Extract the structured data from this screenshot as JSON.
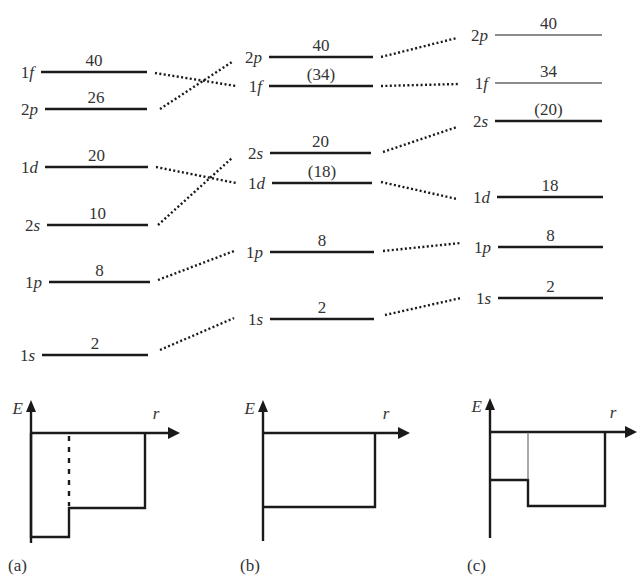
{
  "figure": {
    "columns": [
      {
        "id": "a",
        "levels": [
          {
            "n": "1",
            "l": "f",
            "count": "40",
            "y": 72,
            "x1": 41,
            "x2": 147,
            "w": 2.6
          },
          {
            "n": "2",
            "l": "p",
            "count": "26",
            "y": 109,
            "x1": 45,
            "x2": 147,
            "w": 2.6
          },
          {
            "n": "1",
            "l": "d",
            "count": "20",
            "y": 167,
            "x1": 45,
            "x2": 148,
            "w": 2.6
          },
          {
            "n": "2",
            "l": "s",
            "count": "10",
            "y": 225,
            "x1": 47,
            "x2": 148,
            "w": 2.6
          },
          {
            "n": "1",
            "l": "p",
            "count": "8",
            "y": 282,
            "x1": 49,
            "x2": 150,
            "w": 2.6
          },
          {
            "n": "1",
            "l": "s",
            "count": "2",
            "y": 355,
            "x1": 42,
            "x2": 148,
            "w": 2.6
          }
        ]
      },
      {
        "id": "b",
        "levels": [
          {
            "n": "2",
            "l": "p",
            "count": "40",
            "y": 57,
            "x1": 269,
            "x2": 373,
            "w": 2.6
          },
          {
            "n": "1",
            "l": "f",
            "count": "(34)",
            "y": 86,
            "x1": 269,
            "x2": 373,
            "w": 2.6
          },
          {
            "n": "2",
            "l": "s",
            "count": "20",
            "y": 153,
            "x1": 270,
            "x2": 371,
            "w": 2.6
          },
          {
            "n": "1",
            "l": "d",
            "count": "(18)",
            "y": 183,
            "x1": 272,
            "x2": 372,
            "w": 2.6
          },
          {
            "n": "1",
            "l": "p",
            "count": "8",
            "y": 252,
            "x1": 270,
            "x2": 374,
            "w": 2.6
          },
          {
            "n": "1",
            "l": "s",
            "count": "2",
            "y": 319,
            "x1": 270,
            "x2": 374,
            "w": 2.6
          }
        ]
      },
      {
        "id": "c",
        "levels": [
          {
            "n": "2",
            "l": "p",
            "count": "40",
            "y": 35,
            "x1": 495,
            "x2": 602,
            "w": 1.2
          },
          {
            "n": "1",
            "l": "f",
            "count": "34",
            "y": 83,
            "x1": 495,
            "x2": 602,
            "w": 1.2
          },
          {
            "n": "2",
            "l": "s",
            "count": "(20)",
            "y": 121,
            "x1": 495,
            "x2": 602,
            "w": 2.6
          },
          {
            "n": "1",
            "l": "d",
            "count": "18",
            "y": 197,
            "x1": 497,
            "x2": 603,
            "w": 2.6
          },
          {
            "n": "1",
            "l": "p",
            "count": "8",
            "y": 247,
            "x1": 498,
            "x2": 603,
            "w": 2.6
          },
          {
            "n": "1",
            "l": "s",
            "count": "2",
            "y": 298,
            "x1": 498,
            "x2": 603,
            "w": 2.6
          }
        ]
      }
    ],
    "connectors_ab": [
      {
        "from": "1f",
        "to": "1f",
        "x1": 155,
        "y1": 73,
        "x2": 236,
        "y2": 86
      },
      {
        "from": "2p",
        "to": "2p",
        "x1": 160,
        "y1": 109,
        "x2": 232,
        "y2": 62
      },
      {
        "from": "1d",
        "to": "1d",
        "x1": 156,
        "y1": 167,
        "x2": 236,
        "y2": 183
      },
      {
        "from": "2s",
        "to": "2s",
        "x1": 158,
        "y1": 225,
        "x2": 232,
        "y2": 158
      },
      {
        "from": "1p",
        "to": "1p",
        "x1": 158,
        "y1": 280,
        "x2": 234,
        "y2": 251
      },
      {
        "from": "1s",
        "to": "1s",
        "x1": 160,
        "y1": 350,
        "x2": 234,
        "y2": 318
      }
    ],
    "connectors_bc": [
      {
        "from": "2p",
        "to": "2p",
        "x1": 381,
        "y1": 57,
        "x2": 457,
        "y2": 38
      },
      {
        "from": "1f",
        "to": "1f",
        "x1": 381,
        "y1": 86,
        "x2": 459,
        "y2": 84
      },
      {
        "from": "2s",
        "to": "2s",
        "x1": 383,
        "y1": 152,
        "x2": 457,
        "y2": 127
      },
      {
        "from": "1d",
        "to": "1d",
        "x1": 381,
        "y1": 182,
        "x2": 457,
        "y2": 199
      },
      {
        "from": "1p",
        "to": "1p",
        "x1": 383,
        "y1": 251,
        "x2": 461,
        "y2": 243
      },
      {
        "from": "1s",
        "to": "1s",
        "x1": 385,
        "y1": 315,
        "x2": 461,
        "y2": 298
      }
    ],
    "potentials": [
      {
        "panel_label": "(a)",
        "axis_E": "E",
        "axis_r": "r",
        "origin_x": 31,
        "zero_y": 433,
        "axis_top": 400,
        "axis_bottom": 543,
        "axis_right": 180,
        "path": "M31,433 L31,537 L69,537 L69,508 L145,508 L145,433",
        "dashed": {
          "x": 69,
          "y1": 436,
          "y2": 506
        },
        "thin": null,
        "label_x": 8,
        "label_y": 571
      },
      {
        "panel_label": "(b)",
        "axis_E": "E",
        "axis_r": "r",
        "origin_x": 263,
        "zero_y": 433,
        "axis_top": 400,
        "axis_bottom": 541,
        "axis_right": 410,
        "path": "M263,507 L375,507 L375,433",
        "dashed": null,
        "thin": null,
        "label_x": 240,
        "label_y": 571
      },
      {
        "panel_label": "(c)",
        "axis_E": "E",
        "axis_r": "r",
        "origin_x": 490,
        "zero_y": 432,
        "axis_top": 398,
        "axis_bottom": 538,
        "axis_right": 637,
        "path": "M490,480 L528,480 L528,506 L605,506 L605,432",
        "dashed": null,
        "thin": {
          "x": 528,
          "y1": 432,
          "y2": 480
        },
        "label_x": 467,
        "label_y": 571
      }
    ]
  }
}
